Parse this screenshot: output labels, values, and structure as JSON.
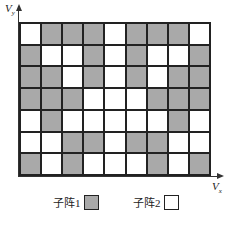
{
  "diagram": {
    "axes": {
      "y_label": "V",
      "y_sub": "y",
      "x_label": "V",
      "x_sub": "x"
    },
    "grid": {
      "columns": 9,
      "rows": 7,
      "cells": [
        [
          "W",
          "G",
          "G",
          "G",
          "W",
          "G",
          "G",
          "G",
          "W"
        ],
        [
          "G",
          "W",
          "W",
          "G",
          "W",
          "G",
          "W",
          "W",
          "G"
        ],
        [
          "G",
          "G",
          "W",
          "G",
          "W",
          "G",
          "W",
          "G",
          "G"
        ],
        [
          "G",
          "G",
          "G",
          "W",
          "W",
          "W",
          "G",
          "G",
          "G"
        ],
        [
          "W",
          "G",
          "W",
          "W",
          "W",
          "W",
          "W",
          "G",
          "W"
        ],
        [
          "W",
          "W",
          "G",
          "G",
          "W",
          "G",
          "G",
          "W",
          "W"
        ],
        [
          "G",
          "W",
          "G",
          "W",
          "W",
          "W",
          "G",
          "W",
          "G"
        ]
      ],
      "legend_key": {
        "G": "子阵1",
        "W": "子阵2"
      }
    },
    "legend": [
      {
        "label": "子阵1",
        "color": "#a9a9a9"
      },
      {
        "label": "子阵2",
        "color": "#ffffff"
      }
    ],
    "colors": {
      "subarray1": "#a9a9a9",
      "subarray2": "#ffffff",
      "line": "#222222"
    }
  }
}
